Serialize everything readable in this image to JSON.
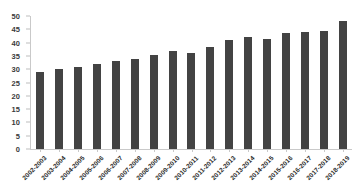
{
  "chart_data": {
    "type": "bar",
    "title": "",
    "subtitle": "",
    "xlabel": "",
    "ylabel": "",
    "ylim": [
      0,
      50
    ],
    "ytick_step": 5,
    "yticks": [
      0,
      5,
      10,
      15,
      20,
      25,
      30,
      35,
      40,
      45,
      50
    ],
    "grid": false,
    "legend": null,
    "bar_color": "#434343",
    "axis_color": "#c9c9c9",
    "categories": [
      "2002-2003",
      "2003-2004",
      "2004-2005",
      "2005-2006",
      "2006-2007",
      "2007-2008",
      "2008-2009",
      "2009-2010",
      "2010-2011",
      "2011-2012",
      "2012-2013",
      "2013-2014",
      "2014-2015",
      "2015-2016",
      "2016-2017",
      "2017-2018",
      "2018-2019"
    ],
    "values": [
      29,
      30,
      31,
      32,
      33,
      34,
      35.5,
      37,
      36,
      38.5,
      41,
      42,
      41.5,
      43.5,
      44,
      44.5,
      48
    ]
  }
}
